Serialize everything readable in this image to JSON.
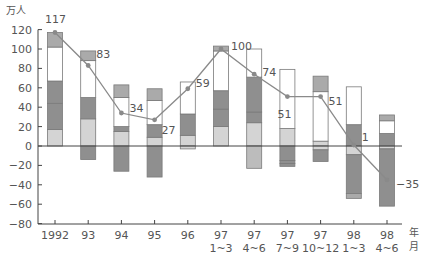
{
  "chart_data": {
    "type": "bar",
    "subtype": "stacked-bar-with-line",
    "title": "",
    "ylabel": "万人",
    "xlabel_units": [
      "年",
      "月"
    ],
    "ylim": [
      -80,
      120
    ],
    "yticks": [
      120,
      100,
      80,
      60,
      40,
      20,
      0,
      -20,
      -40,
      -60,
      -80
    ],
    "grid": false,
    "legend": null,
    "categories": [
      {
        "line1": "1992",
        "line2": ""
      },
      {
        "line1": "93",
        "line2": ""
      },
      {
        "line1": "94",
        "line2": ""
      },
      {
        "line1": "95",
        "line2": ""
      },
      {
        "line1": "96",
        "line2": ""
      },
      {
        "line1": "97",
        "line2": "1~3"
      },
      {
        "line1": "97",
        "line2": "4~6"
      },
      {
        "line1": "97",
        "line2": "7~9"
      },
      {
        "line1": "97",
        "line2": "10~12"
      },
      {
        "line1": "98",
        "line2": "1~3"
      },
      {
        "line1": "98",
        "line2": "4~6"
      }
    ],
    "colors": {
      "light": "#d4d4d4",
      "dark": "#8f8f8f",
      "mid": "#aaaaaa",
      "white": "#ffffff",
      "neglight": "#bcbcbc",
      "line": "#8a8a8a",
      "outline": "#7a7a7a",
      "axis": "#444444"
    },
    "bars": [
      {
        "pos": [
          [
            0,
            17,
            "light"
          ],
          [
            17,
            44,
            "dark"
          ],
          [
            44,
            67,
            "dark"
          ],
          [
            67,
            102,
            "white"
          ],
          [
            102,
            117,
            "mid"
          ]
        ],
        "neg": []
      },
      {
        "pos": [
          [
            0,
            28,
            "light"
          ],
          [
            28,
            50,
            "dark"
          ],
          [
            50,
            88,
            "white"
          ],
          [
            88,
            98,
            "mid"
          ]
        ],
        "neg": [
          [
            0,
            -14,
            "dark"
          ]
        ]
      },
      {
        "pos": [
          [
            0,
            15,
            "light"
          ],
          [
            15,
            20,
            "dark"
          ],
          [
            20,
            50,
            "white"
          ],
          [
            50,
            63,
            "mid"
          ]
        ],
        "neg": [
          [
            0,
            -26,
            "dark"
          ]
        ]
      },
      {
        "pos": [
          [
            0,
            9,
            "light"
          ],
          [
            9,
            22,
            "dark"
          ],
          [
            22,
            47,
            "white"
          ],
          [
            47,
            59,
            "mid"
          ]
        ],
        "neg": [
          [
            0,
            -32,
            "dark"
          ]
        ]
      },
      {
        "pos": [
          [
            0,
            11,
            "light"
          ],
          [
            11,
            33,
            "dark"
          ],
          [
            33,
            66,
            "white"
          ]
        ],
        "neg": [
          [
            0,
            -3,
            "light"
          ]
        ]
      },
      {
        "pos": [
          [
            0,
            20,
            "light"
          ],
          [
            20,
            38,
            "dark"
          ],
          [
            38,
            57,
            "dark"
          ],
          [
            57,
            98,
            "white"
          ],
          [
            98,
            103,
            "mid"
          ]
        ],
        "neg": []
      },
      {
        "pos": [
          [
            0,
            24,
            "light"
          ],
          [
            24,
            35,
            "dark"
          ],
          [
            35,
            71,
            "dark"
          ],
          [
            71,
            100,
            "white"
          ]
        ],
        "neg": [
          [
            0,
            -23,
            "neglight"
          ]
        ]
      },
      {
        "pos": [
          [
            0,
            18,
            "light"
          ],
          [
            18,
            79,
            "white"
          ]
        ],
        "neg": [
          [
            0,
            -15,
            "dark"
          ],
          [
            -15,
            -18,
            "dark"
          ],
          [
            -18,
            -21,
            "dark"
          ]
        ]
      },
      {
        "pos": [
          [
            0,
            5,
            "light"
          ],
          [
            5,
            56,
            "white"
          ],
          [
            56,
            72,
            "mid"
          ]
        ],
        "neg": [
          [
            0,
            -4,
            "light"
          ],
          [
            -4,
            -16,
            "dark"
          ]
        ]
      },
      {
        "pos": [
          [
            0,
            22,
            "dark"
          ],
          [
            22,
            61,
            "white"
          ]
        ],
        "neg": [
          [
            0,
            -9,
            "light"
          ],
          [
            -9,
            -49,
            "dark"
          ],
          [
            -49,
            -54,
            "mid"
          ]
        ]
      },
      {
        "pos": [
          [
            0,
            13,
            "dark"
          ],
          [
            13,
            26,
            "white"
          ],
          [
            26,
            32,
            "mid"
          ]
        ],
        "neg": [
          [
            0,
            -3,
            "light"
          ],
          [
            -3,
            -62,
            "dark"
          ]
        ]
      }
    ],
    "series": [
      {
        "name": "total",
        "type": "line",
        "values": [
          117,
          83,
          34,
          27,
          59,
          100,
          74,
          51,
          51,
          1,
          -35
        ],
        "labels": [
          "117",
          "83",
          "34",
          "27",
          "59",
          "100",
          "74",
          "51",
          "51",
          "1",
          "−35"
        ],
        "label_offsets": [
          [
            -10,
            -14
          ],
          [
            8,
            -11
          ],
          [
            8,
            -5
          ],
          [
            7,
            10
          ],
          [
            8,
            -6
          ],
          [
            10,
            -3
          ],
          [
            8,
            -2
          ],
          [
            -10,
            17
          ],
          [
            8,
            4
          ],
          [
            8,
            -8
          ],
          [
            9,
            4
          ]
        ]
      }
    ]
  }
}
